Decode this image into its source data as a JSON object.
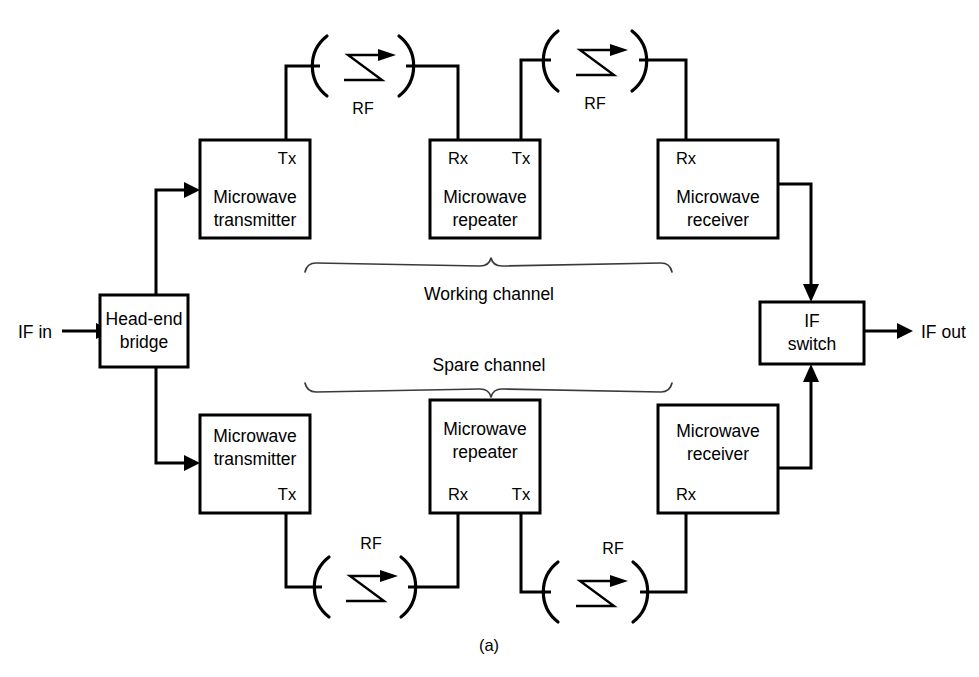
{
  "figure": {
    "caption": "(a)",
    "io": {
      "input_label": "IF in",
      "output_label": "IF out"
    },
    "channels": {
      "working": "Working channel",
      "spare": "Spare channel"
    },
    "ports": {
      "tx": "Tx",
      "rx": "Rx"
    },
    "rf_label": "RF",
    "colors": {
      "background": "#ffffff",
      "line": "#000000",
      "brace": "#3a3a3a"
    },
    "blocks": {
      "bridge": {
        "line1": "Head-end",
        "line2": "bridge"
      },
      "transmitter": {
        "line1": "Microwave",
        "line2": "transmitter"
      },
      "repeater": {
        "line1": "Microwave",
        "line2": "repeater"
      },
      "receiver": {
        "line1": "Microwave",
        "line2": "receiver"
      },
      "switch": {
        "line1": "IF",
        "line2": "switch"
      }
    },
    "working_path": {
      "transmitter": {
        "line1": "Microwave",
        "line2": "transmitter",
        "port": "Tx"
      },
      "repeater": {
        "line1": "Microwave",
        "line2": "repeater",
        "port_in": "Rx",
        "port_out": "Tx"
      },
      "receiver": {
        "line1": "Microwave",
        "line2": "receiver",
        "port": "Rx"
      },
      "hop1_label": "RF",
      "hop2_label": "RF"
    },
    "spare_path": {
      "transmitter": {
        "line1": "Microwave",
        "line2": "transmitter",
        "port": "Tx"
      },
      "repeater": {
        "line1": "Microwave",
        "line2": "repeater",
        "port_in": "Rx",
        "port_out": "Tx"
      },
      "receiver": {
        "line1": "Microwave",
        "line2": "receiver",
        "port": "Rx"
      },
      "hop1_label": "RF",
      "hop2_label": "RF"
    }
  }
}
